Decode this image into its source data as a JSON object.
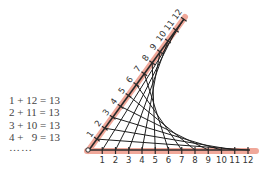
{
  "equations": [
    "1 + 12 = 13",
    "2 + 11 = 13",
    "3 + 10 = 13",
    "4 +   9 = 13"
  ],
  "ellipsis": "……",
  "diagram": {
    "type": "line-stitching envelope",
    "origin_label": "0",
    "horizontal_axis_labels": [
      "1",
      "2",
      "3",
      "4",
      "5",
      "6",
      "7",
      "8",
      "9",
      "10",
      "11",
      "12"
    ],
    "diagonal_axis_labels": [
      "1",
      "2",
      "3",
      "4",
      "5",
      "6",
      "7",
      "8",
      "9",
      "10",
      "11",
      "12"
    ],
    "sum_rule": 13,
    "colors": {
      "axis_band": "#f0a89a",
      "axis_line": "#2a2a2a",
      "stitch_line": "#1e1e1e",
      "label": "#333333"
    }
  }
}
